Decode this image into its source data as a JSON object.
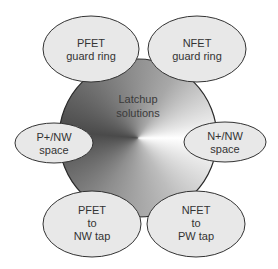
{
  "diagram": {
    "center": {
      "lines": [
        "Latchup",
        "solutions"
      ]
    },
    "nodes": [
      {
        "id": "pfet-guard-ring",
        "lines": [
          "PFET",
          "guard ring"
        ]
      },
      {
        "id": "nfet-guard-ring",
        "lines": [
          "NFET",
          "guard ring"
        ]
      },
      {
        "id": "p-nw-space",
        "lines": [
          "P+/NW",
          "space"
        ]
      },
      {
        "id": "n-nw-space",
        "lines": [
          "N+/NW",
          "space"
        ]
      },
      {
        "id": "pfet-to-nw-tap",
        "lines": [
          "PFET",
          "to",
          "NW tap"
        ]
      },
      {
        "id": "nfet-to-pw-tap",
        "lines": [
          "NFET",
          "to",
          "PW tap"
        ]
      }
    ],
    "colors": {
      "node_fill": "#e8e8e8",
      "outline": "#333333",
      "text": "#333333",
      "gradient_dark": "#4a4a4a",
      "gradient_light": "#ffffff"
    }
  }
}
